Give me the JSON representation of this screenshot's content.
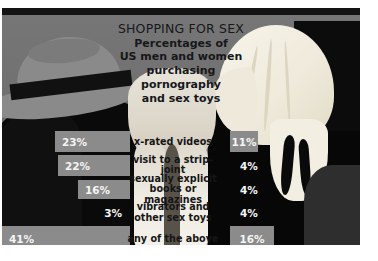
{
  "title": {
    "headline": "SHOPPING FOR SEX",
    "line1": "Percentages of",
    "line2": "US men and women",
    "line3": "purchasing",
    "line4": "pornography",
    "line5": "and sex toys"
  },
  "colors": {
    "bar": "#8b8b8b",
    "canvas": "#6f6f6f",
    "text_dark": "#151517",
    "text_light": "#f4f4f4"
  },
  "chart_data": {
    "type": "bar",
    "title": "SHOPPING FOR SEX",
    "subtitle": "Percentages of US men and women purchasing pornography and sex toys",
    "orientation": "horizontal-diverging",
    "categories": [
      "x-rated videos",
      "visit to a strip-joint",
      "sexually explicit books or magazines",
      "vibrators and other sex toys",
      "any of the above"
    ],
    "series": [
      {
        "name": "men",
        "side": "left",
        "values": [
          23,
          22,
          16,
          3,
          41
        ]
      },
      {
        "name": "women",
        "side": "right",
        "values": [
          11,
          4,
          4,
          4,
          16
        ]
      }
    ],
    "value_suffix": "%",
    "xlabel": "",
    "ylabel": "",
    "grid": false,
    "legend": "none"
  },
  "rows": [
    {
      "label_line1": "x-rated videos",
      "label_line2": "",
      "left_value": "23%",
      "right_value": "11%",
      "left_bar_px": 75,
      "right_bar_px": 28,
      "left_bar_visible": true,
      "right_bar_visible": true,
      "top": 116,
      "height": 21
    },
    {
      "label_line1": "visit to a strip-joint",
      "label_line2": "",
      "left_value": "22%",
      "right_value": "4%",
      "left_bar_px": 72,
      "right_bar_px": 10,
      "left_bar_visible": true,
      "right_bar_visible": false,
      "top": 140,
      "height": 21
    },
    {
      "label_line1": "sexually explicit",
      "label_line2": "books or magazines",
      "left_value": "16%",
      "right_value": "4%",
      "left_bar_px": 52,
      "right_bar_px": 10,
      "left_bar_visible": true,
      "right_bar_visible": false,
      "top": 165,
      "height": 19
    },
    {
      "label_line1": "vibrators and",
      "label_line2": "other sex toys",
      "left_value": "3%",
      "right_value": "4%",
      "left_bar_px": 10,
      "right_bar_px": 10,
      "left_bar_visible": false,
      "right_bar_visible": false,
      "top": 188,
      "height": 20
    },
    {
      "label_line1": "any of the above",
      "label_line2": "",
      "left_value": "41%",
      "right_value": "16%",
      "left_bar_px": 128,
      "right_bar_px": 44,
      "left_bar_visible": true,
      "right_bar_visible": true,
      "top": 211,
      "height": 26
    }
  ]
}
